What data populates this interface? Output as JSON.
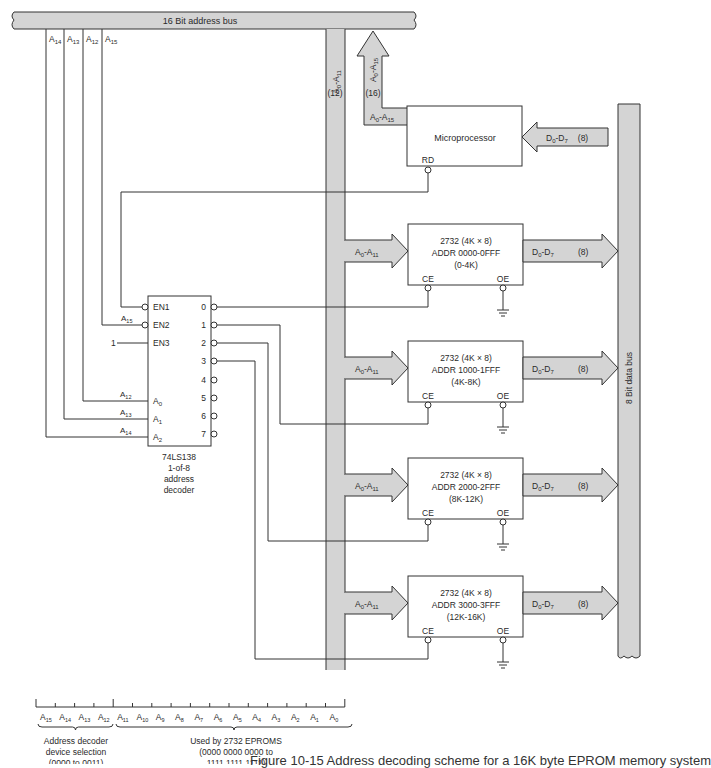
{
  "address_bus": {
    "label": "16 Bit address bus",
    "fill": "#d4d4d4"
  },
  "data_bus": {
    "label": "8 Bit data bus",
    "fill": "#d4d4d4"
  },
  "top_lines": [
    "A14",
    "A13",
    "A12",
    "A15"
  ],
  "eprom_branch": {
    "label_main": "A",
    "label_sub0": "0",
    "label_dash": "-A",
    "label_sub1": "11",
    "width_label": "(12)"
  },
  "cpu_branch": {
    "label_main": "A",
    "label_sub0": "0",
    "label_dash": "-A",
    "label_sub1": "15",
    "width_label": "(16)"
  },
  "microprocessor": {
    "title": "Microprocessor",
    "addr_label": {
      "main": "A",
      "s0": "0",
      "dash": "-A",
      "s1": "15"
    },
    "rd_label": "RD",
    "data_label": {
      "main": "D",
      "s0": "0",
      "dash": "-D",
      "s1": "7",
      "width": "(8)"
    }
  },
  "decoder": {
    "part": "74LS138",
    "line2": "1-of-8",
    "line3": "address",
    "line4": "decoder",
    "inputs": [
      {
        "pin": "EN1",
        "signal": ""
      },
      {
        "pin": "EN2",
        "signal": "A15"
      },
      {
        "pin": "EN3",
        "signal": "1"
      },
      {
        "pin": "A0",
        "signal": "A12"
      },
      {
        "pin": "A1",
        "signal": "A13"
      },
      {
        "pin": "A2",
        "signal": "A14"
      }
    ],
    "outputs": [
      "0",
      "1",
      "2",
      "3",
      "4",
      "5",
      "6",
      "7"
    ]
  },
  "eproms": [
    {
      "line1": "2732 (4K × 8)",
      "line2": "ADDR 0000-0FFF",
      "line3": "(0-4K)",
      "ce": "CE",
      "oe": "OE",
      "addr_in": "A0-A11",
      "data_out": "D0-D7",
      "width": "(8)"
    },
    {
      "line1": "2732 (4K × 8)",
      "line2": "ADDR 1000-1FFF",
      "line3": "(4K-8K)",
      "ce": "CE",
      "oe": "OE",
      "addr_in": "A0-A11",
      "data_out": "D0-D7",
      "width": "(8)"
    },
    {
      "line1": "2732 (4K × 8)",
      "line2": "ADDR 2000-2FFF",
      "line3": "(8K-12K)",
      "ce": "CE",
      "oe": "OE",
      "addr_in": "A0-A11",
      "data_out": "D0-D7",
      "width": "(8)"
    },
    {
      "line1": "2732 (4K × 8)",
      "line2": "ADDR 3000-3FFF",
      "line3": "(12K-16K)",
      "ce": "CE",
      "oe": "OE",
      "addr_in": "A0-A11",
      "data_out": "D0-D7",
      "width": "(8)"
    }
  ],
  "address_map": {
    "bits": [
      "15",
      "14",
      "13",
      "12",
      "11",
      "10",
      "9",
      "8",
      "7",
      "6",
      "5",
      "4",
      "3",
      "2",
      "1",
      "0"
    ],
    "decoder_note": [
      "Address decoder",
      "device selection",
      "(0000 to 0011)"
    ],
    "eprom_note": [
      "Used by 2732 EPROMS",
      "(0000 0000 0000 to",
      "1111 1111 1111)"
    ]
  },
  "caption": "Figure 10-15   Address decoding scheme for a 16K byte EPROM memory system"
}
